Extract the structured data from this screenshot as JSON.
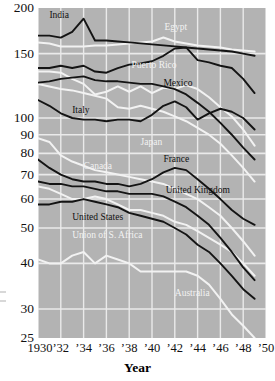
{
  "chart_data": {
    "type": "line",
    "title": "",
    "xlabel": "Year",
    "ylabel": "",
    "yscale": "log",
    "ylim": [
      25,
      200
    ],
    "xlim": [
      1930,
      1950
    ],
    "grid": true,
    "legend": "inline-labels",
    "xticks": [
      "1930",
      "’32",
      "’34",
      "’36",
      "’38",
      "’40",
      "’42",
      "’44",
      "’46",
      "’48",
      "’50"
    ],
    "xtick_values": [
      1930,
      1932,
      1934,
      1936,
      1938,
      1940,
      1942,
      1944,
      1946,
      1948,
      1950
    ],
    "yticks": [
      "200",
      "150",
      "100",
      "90",
      "80",
      "70",
      "60",
      "50",
      "40",
      "30",
      "25"
    ],
    "ytick_values": [
      200,
      150,
      100,
      90,
      80,
      70,
      60,
      50,
      40,
      30,
      25
    ],
    "x": [
      1930,
      1931,
      1932,
      1933,
      1934,
      1935,
      1936,
      1937,
      1938,
      1939,
      1940,
      1941,
      1942,
      1943,
      1944,
      1945,
      1946,
      1947,
      1948,
      1949
    ],
    "series": [
      {
        "name": "India",
        "color": "#141414",
        "label_x": 1931.0,
        "label_y": 196,
        "label_style": "dark",
        "values": [
          168,
          168,
          166,
          172,
          187,
          163,
          163,
          162,
          161,
          160,
          159,
          158,
          157,
          156,
          155,
          154,
          153,
          152,
          150,
          148
        ]
      },
      {
        "name": "Egypt",
        "color": "#f2f2f2",
        "label_x": 1941.1,
        "label_y": 182,
        "label_style": "light",
        "values": [
          161,
          160,
          157,
          157,
          157,
          158,
          158,
          159,
          160,
          161,
          162,
          166,
          162,
          160,
          158,
          157,
          156,
          154,
          153,
          152
        ]
      },
      {
        "name": "Egypt-dark",
        "color": "#141414",
        "label_x": null,
        "label_y": null,
        "label_style": "dark",
        "values": [
          137,
          137,
          139,
          137,
          139,
          134,
          133,
          137,
          140,
          141,
          143,
          148,
          155,
          156,
          144,
          142,
          139,
          137,
          128,
          117
        ]
      },
      {
        "name": "Puerto Rico",
        "color": "#f2f2f2",
        "label_x": 1938.2,
        "label_y": 143,
        "label_style": "light",
        "values": [
          134,
          134,
          133,
          128,
          124,
          116,
          118,
          122,
          118,
          122,
          117,
          121,
          120,
          123,
          120,
          114,
          107,
          101,
          93,
          84
        ]
      },
      {
        "name": "Mexico",
        "color": "#141414",
        "label_x": 1941.0,
        "label_y": 128,
        "label_style": "dark",
        "values": [
          125,
          126,
          128,
          129,
          130,
          127,
          126,
          126,
          125,
          124,
          124,
          122,
          120,
          116,
          110,
          104,
          97,
          90,
          83,
          77
        ]
      },
      {
        "name": "Italy",
        "color": "#141414",
        "label_x": 1933.0,
        "label_y": 108,
        "label_style": "dark",
        "values": [
          112,
          108,
          103,
          100,
          99,
          99,
          98,
          99,
          99,
          98,
          102,
          108,
          111,
          107,
          99,
          103,
          106,
          104,
          100,
          93
        ]
      },
      {
        "name": "Japan",
        "color": "#f2f2f2",
        "label_x": 1939.0,
        "label_y": 88,
        "label_style": "light",
        "values": [
          124,
          122,
          120,
          119,
          117,
          115,
          113,
          107,
          106,
          108,
          106,
          104,
          101,
          98,
          94,
          90,
          85,
          79,
          73,
          67
        ]
      },
      {
        "name": "Canada",
        "color": "#f2f2f2",
        "label_x": 1934.0,
        "label_y": 76,
        "label_style": "light",
        "values": [
          88,
          86,
          79,
          76,
          74,
          72,
          71,
          70,
          69,
          68,
          67,
          66,
          64,
          62,
          60,
          57,
          54,
          50,
          46,
          42
        ]
      },
      {
        "name": "France",
        "color": "#141414",
        "label_x": 1941.0,
        "label_y": 79,
        "label_style": "dark",
        "values": [
          77,
          73,
          70,
          68,
          67,
          67,
          66,
          66,
          65,
          66,
          68,
          71,
          73,
          72,
          68,
          64,
          60,
          56,
          53,
          51
        ]
      },
      {
        "name": "United Kingdom",
        "color": "#141414",
        "label_x": 1941.2,
        "label_y": 65,
        "label_style": "dark",
        "values": [
          67,
          66,
          66,
          65,
          65,
          64,
          63,
          63,
          62,
          62,
          62,
          61,
          59,
          57,
          54,
          51,
          47,
          43,
          39,
          36
        ]
      },
      {
        "name": "United States",
        "color": "#141414",
        "label_x": 1933.0,
        "label_y": 55,
        "label_style": "dark",
        "values": [
          58,
          58,
          59,
          59,
          60,
          59,
          58,
          57,
          55,
          54,
          53,
          52,
          50,
          48,
          45,
          43,
          40,
          37,
          34,
          32
        ]
      },
      {
        "name": "Union of S. Africa",
        "color": "#f2f2f2",
        "label_x": 1933.0,
        "label_y": 49,
        "label_style": "light",
        "values": [
          65,
          64,
          62,
          60,
          60,
          61,
          60,
          58,
          56,
          56,
          55,
          54,
          52,
          51,
          49,
          47,
          45,
          43,
          40,
          37
        ]
      },
      {
        "name": "Australia",
        "color": "#f2f2f2",
        "label_x": 1942.0,
        "label_y": 34,
        "label_style": "light",
        "values": [
          41,
          40,
          40,
          42,
          43,
          40,
          42,
          41,
          40,
          38,
          38,
          38,
          38,
          38,
          37,
          35,
          32,
          29,
          27,
          25
        ]
      }
    ]
  },
  "axis": {
    "x_title": "Year"
  }
}
